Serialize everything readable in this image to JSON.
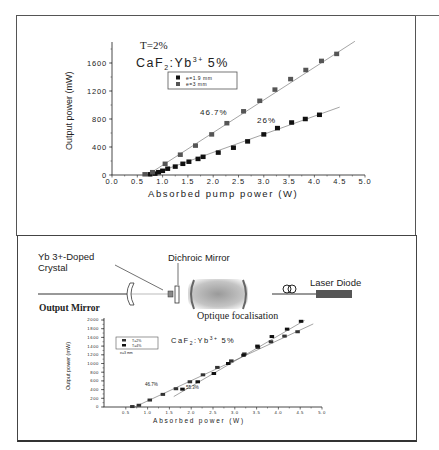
{
  "top_figure": {
    "annotation_T": "T=2%",
    "annotation_material": "CaF",
    "annotation_material_sub": "2",
    "annotation_material_rest": ":Yb",
    "annotation_material_sup": "3+",
    "annotation_material_conc": "5%",
    "slope_label_1": "46.7%",
    "slope_label_2": "26%"
  },
  "bottom_figure": {
    "label_crystal_line1": "Yb 3+-Doped",
    "label_crystal_line2": "Crystal",
    "label_dichroic": "Dichroic Mirror",
    "label_laser_diode": "Laser Diode",
    "label_output_mirror": "Output Mirror",
    "label_optique": "Optique focalisation",
    "annotation_material": "CaF",
    "annotation_material_sub": "2",
    "annotation_material_rest": ":Yb",
    "annotation_material_sup": "3+",
    "annotation_material_conc": "5%",
    "legend_note": "e=3 mm",
    "slope_label_1": "46.7%",
    "slope_label_2": "55.3%"
  },
  "chart_data": [
    {
      "type": "scatter",
      "title": "",
      "xlabel": "Absorbed pump power (W)",
      "ylabel": "Output power (mW)",
      "xlim": [
        0.0,
        5.0
      ],
      "ylim": [
        0,
        1900
      ],
      "xticks": [
        "0.0",
        "0.5",
        "1.0",
        "1.5",
        "2.0",
        "2.5",
        "3.0",
        "3.5",
        "4.0",
        "4.5",
        "5.0"
      ],
      "yticks": [
        "0",
        "400",
        "800",
        "1200",
        "1600"
      ],
      "legend_position": "upper-left-inside",
      "annotations": [
        "T=2%",
        "CaF2:Yb3+ 5%",
        "46.7%",
        "26%"
      ],
      "series": [
        {
          "name": "e=1.9 mm",
          "color": "#111111",
          "x": [
            0.75,
            0.85,
            0.92,
            1.0,
            1.1,
            1.25,
            1.4,
            1.52,
            1.7,
            1.8,
            2.1,
            2.4,
            2.68,
            3.0,
            3.27,
            3.55,
            3.82,
            4.1
          ],
          "y": [
            10,
            20,
            40,
            60,
            90,
            120,
            160,
            190,
            230,
            260,
            320,
            390,
            480,
            580,
            670,
            750,
            800,
            860
          ],
          "fit": {
            "x": [
              0.75,
              4.5
            ],
            "y": [
              0,
              970
            ],
            "slope_label": "26%"
          }
        },
        {
          "name": "e=3 mm",
          "color": "#555555",
          "x": [
            0.65,
            0.8,
            1.05,
            1.35,
            1.65,
            1.97,
            2.27,
            2.6,
            2.92,
            3.22,
            3.53,
            3.83,
            4.14,
            4.44
          ],
          "y": [
            10,
            40,
            160,
            290,
            420,
            580,
            740,
            910,
            1060,
            1220,
            1370,
            1500,
            1630,
            1730
          ],
          "fit": {
            "x": [
              0.7,
              4.8
            ],
            "y": [
              0,
              1910
            ],
            "slope_label": "46.7%"
          }
        }
      ]
    },
    {
      "type": "scatter",
      "title": "",
      "xlabel": "Absorbed power (W)",
      "ylabel": "Output power (mW)",
      "xlim": [
        0.0,
        5.0
      ],
      "ylim": [
        0,
        2000
      ],
      "xticks": [
        "0.5",
        "1.0",
        "1.5",
        "2.0",
        "2.5",
        "3.0",
        "3.5",
        "4.0",
        "4.5",
        "5.0"
      ],
      "yticks": [
        "0",
        "200",
        "400",
        "600",
        "800",
        "1000",
        "1200",
        "1400",
        "1600",
        "1800",
        "2000"
      ],
      "legend_position": "upper-left-inside",
      "annotations": [
        "CaF2:Yb3+ 5%",
        "e=3 mm",
        "46.7%",
        "55.3%"
      ],
      "series": [
        {
          "name": "T=2%",
          "color": "#333333",
          "x": [
            0.65,
            0.8,
            1.05,
            1.35,
            1.65,
            1.97,
            2.27,
            2.6,
            2.92,
            3.22,
            3.53,
            3.83,
            4.14,
            4.44
          ],
          "y": [
            10,
            40,
            160,
            290,
            420,
            580,
            740,
            910,
            1060,
            1220,
            1370,
            1500,
            1630,
            1730
          ],
          "fit": {
            "x": [
              0.7,
              4.8
            ],
            "y": [
              0,
              1910
            ],
            "slope_label": "46.7%"
          }
        },
        {
          "name": "T=4%",
          "color": "#111111",
          "x": [
            1.8,
            2.15,
            2.52,
            2.85,
            3.2,
            3.52,
            3.85,
            4.2,
            4.52
          ],
          "y": [
            410,
            580,
            770,
            1000,
            1190,
            1400,
            1620,
            1790,
            1970
          ],
          "fit": {
            "x": [
              1.6,
              4.6
            ],
            "y": [
              240,
              1990
            ],
            "slope_label": "55.3%"
          }
        }
      ]
    }
  ]
}
